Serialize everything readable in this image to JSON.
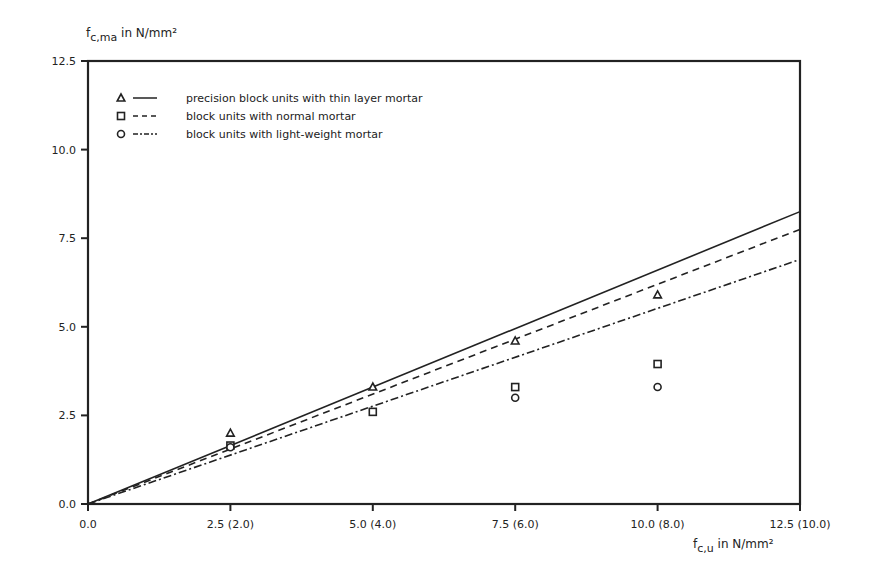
{
  "chart_data": {
    "type": "line",
    "title": "",
    "ylabel": {
      "main": "f",
      "sub": "c,ma",
      "unit": " in N/mm²"
    },
    "xlabel": {
      "main": "f",
      "sub": "c,u",
      "unit": " in N/mm²"
    },
    "xlim": [
      0,
      12.5
    ],
    "ylim": [
      0,
      12.5
    ],
    "x_ticks": [
      {
        "value": 0,
        "label": "0.0"
      },
      {
        "value": 2.5,
        "label": "2.5 (2.0)"
      },
      {
        "value": 5.0,
        "label": "5.0 (4.0)"
      },
      {
        "value": 7.5,
        "label": "7.5 (6.0)"
      },
      {
        "value": 10.0,
        "label": "10.0 (8.0)"
      },
      {
        "value": 12.5,
        "label": "12.5 (10.0)"
      }
    ],
    "y_ticks": [
      {
        "value": 0,
        "label": "0.0"
      },
      {
        "value": 2.5,
        "label": "2.5"
      },
      {
        "value": 5.0,
        "label": "5.0"
      },
      {
        "value": 7.5,
        "label": "7.5"
      },
      {
        "value": 10.0,
        "label": "10.0"
      },
      {
        "value": 12.5,
        "label": "12.5"
      }
    ],
    "grid": false,
    "legend_position": "top-left inside",
    "series": [
      {
        "name": "precision block units with thin layer mortar",
        "marker": "triangle",
        "line_style": "solid",
        "points": [
          [
            2.5,
            2.0
          ],
          [
            5.0,
            3.3
          ],
          [
            7.5,
            4.6
          ],
          [
            10.0,
            5.9
          ]
        ],
        "fit_line": [
          [
            0,
            0
          ],
          [
            12.5,
            8.25
          ]
        ]
      },
      {
        "name": "block units with normal mortar",
        "marker": "square",
        "line_style": "dashed",
        "points": [
          [
            2.5,
            1.65
          ],
          [
            5.0,
            2.6
          ],
          [
            7.5,
            3.3
          ],
          [
            10.0,
            3.95
          ]
        ],
        "fit_line": [
          [
            0,
            0
          ],
          [
            12.5,
            7.75
          ]
        ]
      },
      {
        "name": "block units with light-weight mortar",
        "marker": "circle",
        "line_style": "dash-dot",
        "points": [
          [
            2.5,
            1.6
          ],
          [
            7.5,
            3.0
          ],
          [
            10.0,
            3.3
          ]
        ],
        "fit_line": [
          [
            0,
            0
          ],
          [
            12.5,
            6.9
          ]
        ]
      }
    ]
  }
}
